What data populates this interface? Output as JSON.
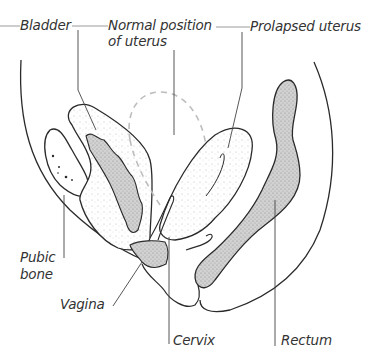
{
  "diagram": {
    "colors": {
      "outline": "#2a2a2a",
      "leader": "#6a6a6a",
      "dashed": "#bdbdbd",
      "shaded": "#c8c8c8",
      "text": "#333333"
    },
    "labels": {
      "bladder": "Bladder",
      "normal_position_1": "Normal position",
      "normal_position_2": "of uterus",
      "prolapsed_uterus": "Prolapsed uterus",
      "pubic_bone_1": "Pubic",
      "pubic_bone_2": "bone",
      "vagina": "Vagina",
      "cervix": "Cervix",
      "rectum": "Rectum"
    }
  }
}
